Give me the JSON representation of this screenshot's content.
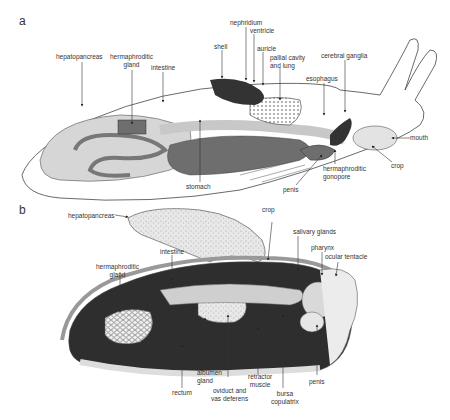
{
  "panel_a": {
    "letter": "a",
    "labels": {
      "hepatopancreas": "hepatopancreas",
      "hermaphroditic_gland": "hermaphroditic\ngland",
      "intestine": "intestine",
      "shell": "shell",
      "nephridium": "nephridium",
      "ventricle": "ventricle",
      "auricle": "auricle",
      "pallial_cavity": "pallial cavity\nand lung",
      "cerebral_ganglia": "cerebral ganglia",
      "esophagus": "esophagus",
      "mouth": "mouth",
      "crop": "crop",
      "hermaphroditic_gonopore": "hermaphroditic\ngonopore",
      "penis": "penis",
      "stomach": "stomach"
    }
  },
  "panel_b": {
    "letter": "b",
    "labels": {
      "hepatopancreas": "hepatopancreas",
      "crop": "crop",
      "salivary_glands": "salivary glands",
      "pharynx": "pharynx",
      "ocular_tentacle": "ocular tentacle",
      "intestine": "intestine",
      "hermaphroditic_gland": "hermaphroditic\ngland",
      "rectum": "rectum",
      "albumen_gland": "albumen\ngland",
      "oviduct": "oviduct and\nvas deferens",
      "retractor_muscle": "retractor\nmuscle",
      "bursa_copulatrix": "bursa\ncopulatrix",
      "penis": "penis"
    }
  },
  "colors": {
    "outline": "#444444",
    "light_fill": "#d6d6d6",
    "mid_fill": "#bdbdbd",
    "dark_fill": "#6e6e6e",
    "darkest": "#222222"
  }
}
